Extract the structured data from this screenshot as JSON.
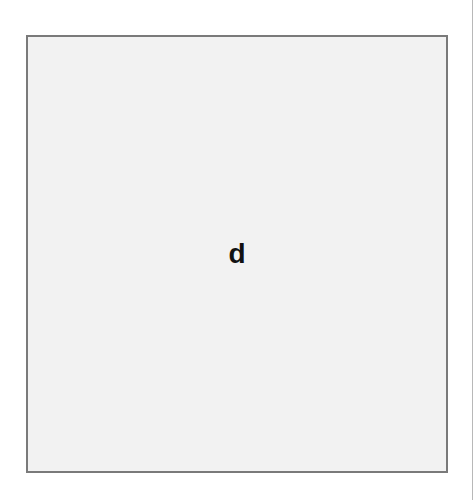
{
  "card": {
    "letter": "d"
  },
  "colors": {
    "card_background": "#f2f2f2",
    "card_border": "#7a7a7a",
    "letter": "#111111",
    "page_background": "#ffffff"
  }
}
